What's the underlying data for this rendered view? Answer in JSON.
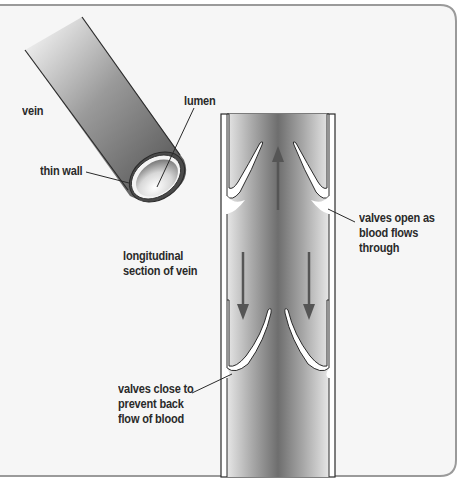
{
  "diagram": {
    "colors": {
      "frame": "#9a9a9a",
      "background": "#f6f6f6",
      "tube_dark": "#5a5a5a",
      "tube_light": "#ffffff",
      "outline": "#2a2a2a",
      "arrow": "#555555",
      "text": "#2a2a2a"
    },
    "labels": {
      "vein": "vein",
      "lumen": "lumen",
      "thin_wall": "thin wall",
      "longitudinal_section": [
        "longitudinal",
        "section of vein"
      ],
      "valves_open": [
        "valves open as",
        "blood flows",
        "through"
      ],
      "valves_close": [
        "valves close to",
        "prevent back",
        "flow of blood"
      ]
    },
    "arrows": [
      {
        "name": "upward-flow-arrow",
        "direction": "up"
      },
      {
        "name": "backflow-arrow-left",
        "direction": "down"
      },
      {
        "name": "backflow-arrow-right",
        "direction": "down"
      }
    ]
  }
}
